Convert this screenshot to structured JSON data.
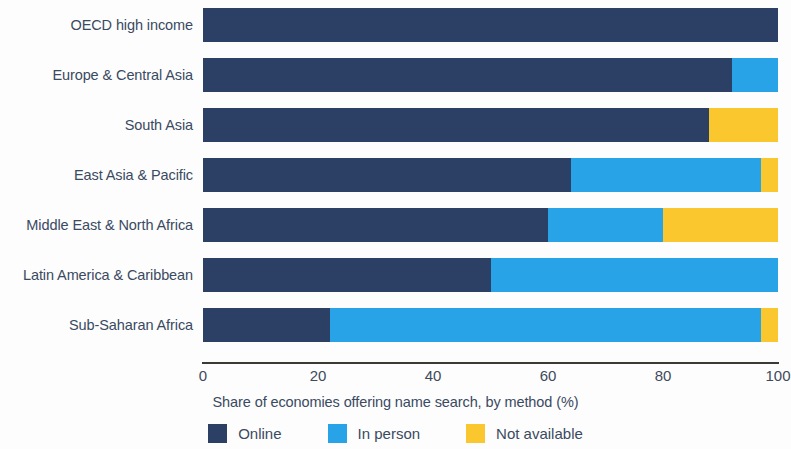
{
  "chart_data": {
    "type": "bar",
    "orientation": "horizontal",
    "stacked": true,
    "title": "",
    "xlabel": "Share of economies offering name search, by method (%)",
    "ylabel": "",
    "xlim": [
      0,
      100
    ],
    "xticks": [
      0,
      20,
      40,
      60,
      80,
      100
    ],
    "xtick_labels": [
      "0",
      "20",
      "40",
      "60",
      "80",
      "100"
    ],
    "grid": false,
    "legend_position": "bottom",
    "categories": [
      "OECD high income",
      "Europe & Central Asia",
      "South Asia",
      "East Asia & Pacific",
      "Middle East & North Africa",
      "Latin America & Caribbean",
      "Sub-Saharan Africa"
    ],
    "series": [
      {
        "name": "Online",
        "color": "#2c3f64",
        "values": [
          100,
          92,
          88,
          64,
          60,
          50,
          22
        ]
      },
      {
        "name": "In person",
        "color": "#29a3e8",
        "values": [
          0,
          8,
          0,
          33,
          20,
          50,
          75
        ]
      },
      {
        "name": "Not available",
        "color": "#fbc72e",
        "values": [
          0,
          0,
          12,
          3,
          20,
          0,
          3
        ]
      }
    ]
  },
  "axis": {
    "title": "Share of economies offering name search, by method (%)",
    "ticks": [
      "0",
      "20",
      "40",
      "60",
      "80",
      "100"
    ]
  },
  "legend": {
    "items": [
      {
        "label": "Online",
        "color": "#2c3f64"
      },
      {
        "label": "In person",
        "color": "#29a3e8"
      },
      {
        "label": "Not available",
        "color": "#fbc72e"
      }
    ]
  }
}
